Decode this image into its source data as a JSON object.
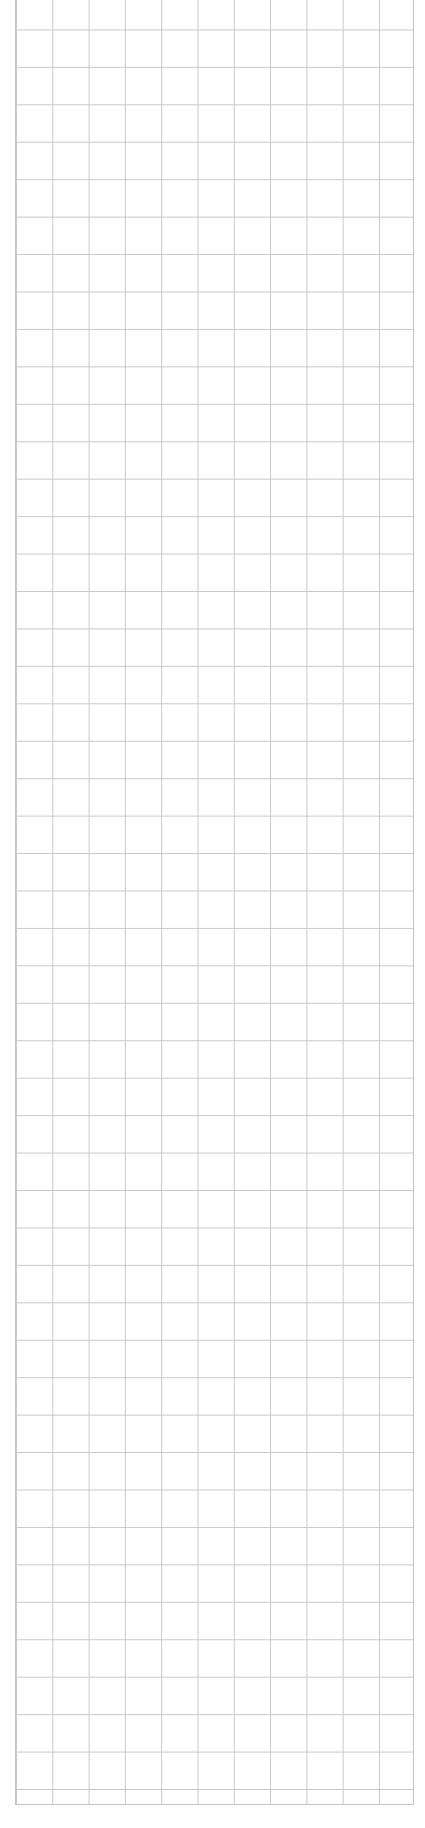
{
  "page": {
    "type": "graph-paper",
    "background_color": "#ffffff",
    "grid_line_color": "#c8c8c8",
    "columns": 11,
    "rows": 48,
    "cell_width_px": 36.3,
    "cell_height_px": 37.45
  }
}
